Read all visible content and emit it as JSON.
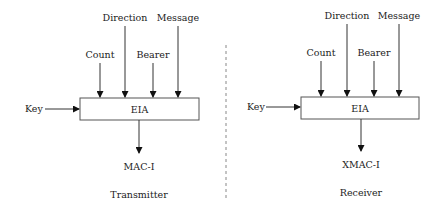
{
  "diagram": {
    "divider": {
      "style": "dashed",
      "color": "#888888"
    },
    "panels": [
      {
        "id": "transmitter",
        "caption": "Transmitter",
        "block": "EIA",
        "inputs": {
          "top": [
            "Count",
            "Direction",
            "Bearer",
            "Message"
          ],
          "left": "Key"
        },
        "output": "MAC-I"
      },
      {
        "id": "receiver",
        "caption": "Receiver",
        "block": "EIA",
        "inputs": {
          "top": [
            "Count",
            "Direction",
            "Bearer",
            "Message"
          ],
          "left": "Key"
        },
        "output": "XMAC-I"
      }
    ]
  }
}
